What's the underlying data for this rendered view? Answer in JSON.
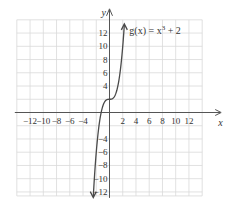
{
  "chart_data": {
    "type": "line",
    "title": "",
    "xlabel": "x",
    "ylabel": "y",
    "xlim": [
      -14,
      14
    ],
    "ylim": [
      -12.6,
      14
    ],
    "grid": true,
    "grid_step": 2,
    "x_tick_labels": [
      {
        "value": -12,
        "label": "−12"
      },
      {
        "value": -10,
        "label": "−10"
      },
      {
        "value": -8,
        "label": "−8"
      },
      {
        "value": -6,
        "label": "−6"
      },
      {
        "value": -4,
        "label": "−4"
      },
      {
        "value": 2,
        "label": "2"
      },
      {
        "value": 4,
        "label": "4"
      },
      {
        "value": 6,
        "label": "6"
      },
      {
        "value": 8,
        "label": "8"
      },
      {
        "value": 10,
        "label": "10"
      },
      {
        "value": 12,
        "label": "12"
      }
    ],
    "y_tick_labels": [
      {
        "value": 12,
        "label": "12"
      },
      {
        "value": 10,
        "label": "10"
      },
      {
        "value": 8,
        "label": "8"
      },
      {
        "value": 6,
        "label": "6"
      },
      {
        "value": 4,
        "label": "4"
      },
      {
        "value": -4,
        "label": "−4"
      },
      {
        "value": -6,
        "label": "−6"
      },
      {
        "value": -8,
        "label": "−8"
      },
      {
        "value": -10,
        "label": "−10"
      },
      {
        "value": -12,
        "label": "−12"
      }
    ],
    "series": [
      {
        "name": "g(x) = x^3 + 2",
        "function": "x^3 + 2",
        "x_range": [
          -2.45,
          2.24
        ],
        "arrows": "both",
        "points": [
          [
            -2.4,
            -11.8
          ],
          [
            -2,
            -6
          ],
          [
            -1.5,
            -1.4
          ],
          [
            -1,
            1
          ],
          [
            0,
            2
          ],
          [
            1,
            3
          ],
          [
            1.5,
            5.4
          ],
          [
            2,
            10
          ],
          [
            2.2,
            12.6
          ]
        ]
      }
    ],
    "annotations": [
      {
        "text_prefix": "g(x) = x",
        "superscript": "3",
        "text_suffix": " + 2",
        "anchor": "top-right of curve"
      }
    ]
  }
}
